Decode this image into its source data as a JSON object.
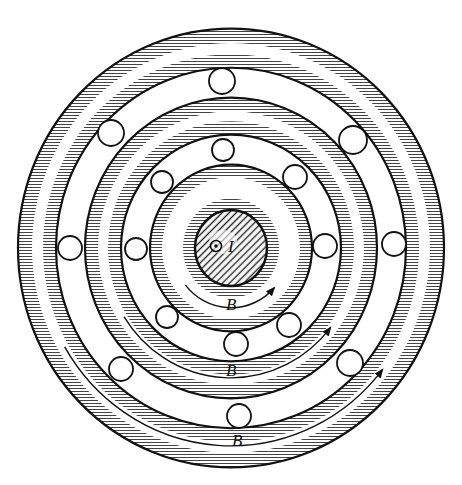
{
  "diagram": {
    "type": "coaxial ball-bearing / magnetic field schematic",
    "colors": {
      "ink": "#111111",
      "background": "#ffffff"
    },
    "center_label": "I",
    "center_symbol": "current-out-of-page-dot",
    "field_label": "B",
    "field_arrows": [
      {
        "label": "B",
        "direction": "counterclockwise"
      },
      {
        "label": "B",
        "direction": "counterclockwise"
      },
      {
        "label": "B",
        "direction": "counterclockwise"
      }
    ],
    "ball_channels": [
      {
        "name": "outer-channel",
        "ball_count": 6
      },
      {
        "name": "inner-channel",
        "ball_count": 6
      }
    ],
    "ring_count": 5
  }
}
